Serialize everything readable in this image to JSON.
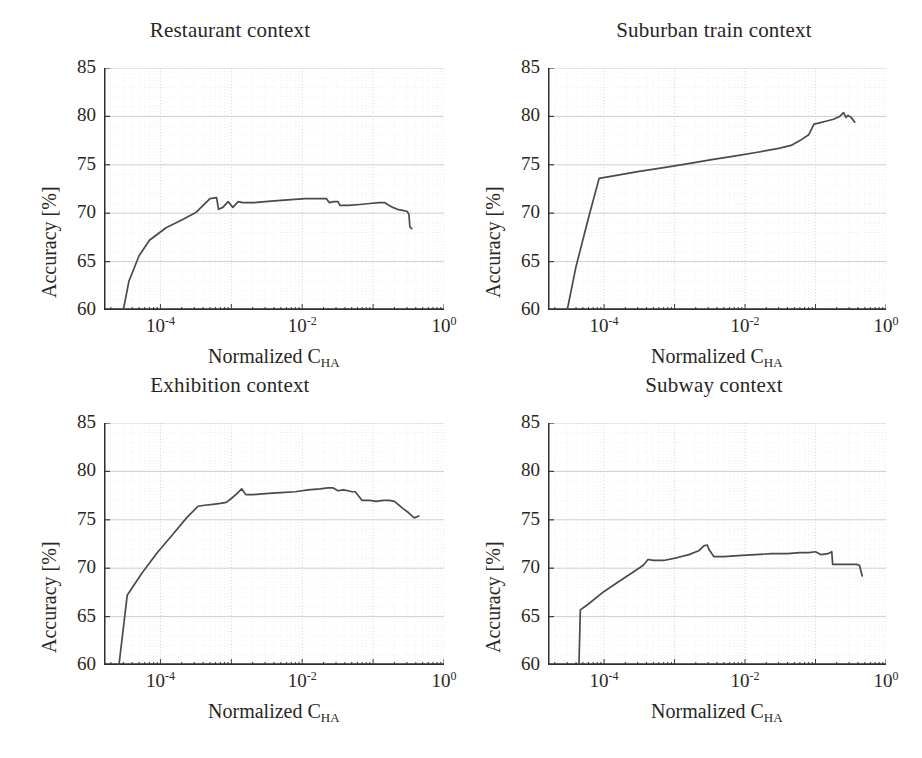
{
  "figure": {
    "panel_count": 4,
    "shared_xlabel_main": "Normalized C",
    "shared_xlabel_sub": "HA",
    "shared_ylabel": "Accuracy [%]"
  },
  "chart_data": [
    {
      "type": "line",
      "title": "Restaurant context",
      "xlabel": "Normalized C_HA",
      "ylabel": "Accuracy [%]",
      "xscale": "log",
      "xlim": [
        1.6e-05,
        1.0
      ],
      "ylim": [
        60,
        85
      ],
      "yticks": [
        60,
        65,
        70,
        75,
        80,
        85
      ],
      "xticks": [
        0.0001,
        0.01,
        1.0
      ],
      "xticklabels": [
        "10-4",
        "10-2",
        "100"
      ],
      "grid": true,
      "legend": "none",
      "series": [
        {
          "name": "accuracy",
          "x": [
            3e-05,
            3.6e-05,
            5e-05,
            7e-05,
            0.00012,
            0.0002,
            0.00032,
            0.0005,
            0.00062,
            0.00066,
            0.00076,
            0.0009,
            0.00105,
            0.00125,
            0.00145,
            0.0017,
            0.0021,
            0.003,
            0.0045,
            0.007,
            0.011,
            0.016,
            0.022,
            0.024,
            0.028,
            0.032,
            0.034,
            0.045,
            0.065,
            0.09,
            0.12,
            0.145,
            0.16,
            0.19,
            0.22,
            0.26,
            0.3,
            0.32,
            0.33,
            0.35
          ],
          "y": [
            60.0,
            63.0,
            65.6,
            67.2,
            68.5,
            69.3,
            70.1,
            71.5,
            71.6,
            70.4,
            70.6,
            71.2,
            70.6,
            71.2,
            71.1,
            71.1,
            71.1,
            71.2,
            71.3,
            71.4,
            71.5,
            71.5,
            71.5,
            71.1,
            71.2,
            71.2,
            70.8,
            70.8,
            70.9,
            71.0,
            71.1,
            71.1,
            70.9,
            70.6,
            70.4,
            70.3,
            70.2,
            69.9,
            68.6,
            68.4
          ]
        }
      ]
    },
    {
      "type": "line",
      "title": "Suburban train context",
      "xlabel": "Normalized C_HA",
      "ylabel": "Accuracy [%]",
      "xscale": "log",
      "xlim": [
        1.6e-05,
        1.0
      ],
      "ylim": [
        60,
        85
      ],
      "yticks": [
        60,
        65,
        70,
        75,
        80,
        85
      ],
      "xticks": [
        0.0001,
        0.01,
        1.0
      ],
      "xticklabels": [
        "10-4",
        "10-2",
        "100"
      ],
      "grid": true,
      "legend": "none",
      "series": [
        {
          "name": "accuracy",
          "x": [
            3e-05,
            4e-05,
            6e-05,
            8.5e-05,
            0.00015,
            0.0003,
            0.0007,
            0.0015,
            0.0032,
            0.007,
            0.015,
            0.03,
            0.045,
            0.06,
            0.08,
            0.095,
            0.11,
            0.14,
            0.18,
            0.22,
            0.25,
            0.27,
            0.29,
            0.32,
            0.36
          ],
          "y": [
            60.0,
            64.5,
            69.5,
            73.6,
            73.9,
            74.3,
            74.7,
            75.1,
            75.5,
            75.9,
            76.3,
            76.7,
            77.0,
            77.5,
            78.1,
            79.2,
            79.3,
            79.5,
            79.7,
            80.0,
            80.4,
            79.9,
            80.1,
            79.9,
            79.4
          ]
        }
      ]
    },
    {
      "type": "line",
      "title": "Exhibition context",
      "xlabel": "Normalized C_HA",
      "ylabel": "Accuracy [%]",
      "xscale": "log",
      "xlim": [
        1.6e-05,
        1.0
      ],
      "ylim": [
        60,
        85
      ],
      "yticks": [
        60,
        65,
        70,
        75,
        80,
        85
      ],
      "xticks": [
        0.0001,
        0.01,
        1.0
      ],
      "xticklabels": [
        "10-4",
        "10-2",
        "100"
      ],
      "grid": true,
      "legend": "none",
      "series": [
        {
          "name": "accuracy",
          "x": [
            2.6e-05,
            3.4e-05,
            5.5e-05,
            9e-05,
            0.00015,
            0.00024,
            0.00034,
            0.00042,
            0.00055,
            0.0007,
            0.00085,
            0.001,
            0.0012,
            0.0014,
            0.0016,
            0.002,
            0.003,
            0.005,
            0.008,
            0.012,
            0.018,
            0.023,
            0.027,
            0.032,
            0.038,
            0.045,
            0.05,
            0.056,
            0.07,
            0.09,
            0.11,
            0.14,
            0.17,
            0.2,
            0.26,
            0.32,
            0.38,
            0.44
          ],
          "y": [
            60.0,
            67.2,
            69.5,
            71.6,
            73.5,
            75.3,
            76.4,
            76.5,
            76.6,
            76.7,
            76.8,
            77.2,
            77.7,
            78.2,
            77.6,
            77.6,
            77.7,
            77.8,
            77.9,
            78.1,
            78.2,
            78.3,
            78.3,
            78.0,
            78.1,
            78.0,
            77.9,
            77.9,
            77.0,
            77.0,
            76.9,
            77.0,
            77.0,
            76.9,
            76.2,
            75.7,
            75.2,
            75.4
          ]
        }
      ]
    },
    {
      "type": "line",
      "title": "Subway context",
      "xlabel": "Normalized C_HA",
      "ylabel": "Accuracy [%]",
      "xscale": "log",
      "xlim": [
        1.6e-05,
        1.0
      ],
      "ylim": [
        60,
        85
      ],
      "yticks": [
        60,
        65,
        70,
        75,
        80,
        85
      ],
      "xticks": [
        0.0001,
        0.01,
        1.0
      ],
      "xticklabels": [
        "10-4",
        "10-2",
        "100"
      ],
      "grid": true,
      "legend": "none",
      "series": [
        {
          "name": "accuracy",
          "x": [
            4.4e-05,
            4.6e-05,
            6e-05,
            0.0001,
            0.00016,
            0.00026,
            0.00036,
            0.00042,
            0.0005,
            0.0007,
            0.0011,
            0.0016,
            0.0022,
            0.0026,
            0.0029,
            0.0031,
            0.0036,
            0.005,
            0.008,
            0.014,
            0.024,
            0.04,
            0.06,
            0.08,
            0.1,
            0.12,
            0.15,
            0.17,
            0.175,
            0.22,
            0.3,
            0.38,
            0.42,
            0.46
          ],
          "y": [
            60.0,
            65.7,
            66.3,
            67.6,
            68.6,
            69.6,
            70.3,
            70.9,
            70.8,
            70.8,
            71.1,
            71.4,
            71.8,
            72.3,
            72.4,
            71.9,
            71.2,
            71.2,
            71.3,
            71.4,
            71.5,
            71.5,
            71.6,
            71.6,
            71.7,
            71.4,
            71.5,
            71.7,
            70.4,
            70.4,
            70.4,
            70.4,
            70.3,
            69.2
          ]
        }
      ]
    }
  ]
}
